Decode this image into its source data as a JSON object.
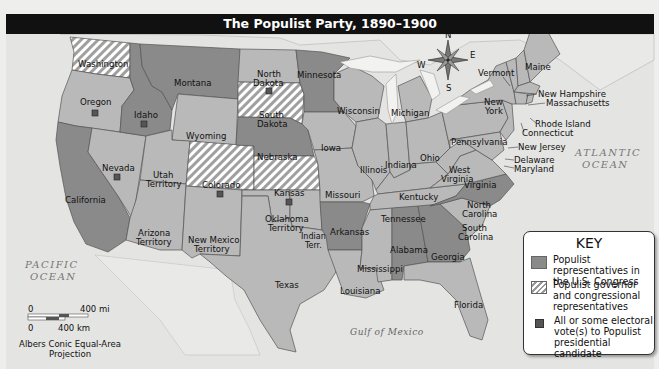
{
  "title": "The Populist Party, 1890–1900",
  "colors": {
    "populist_reps": "#8a8a8a",
    "other_state": "#b9b9b9",
    "water": "#e6e6e4",
    "hatch_light": "#ffffff",
    "hatch_dark": "#9c9c9c",
    "electoral_marker": "#555555",
    "title_bg": "#111111"
  },
  "compass": {
    "n": "N",
    "s": "S",
    "e": "E",
    "w": "W"
  },
  "water_labels": {
    "pacific": [
      "PACIFIC",
      "OCEAN"
    ],
    "atlantic": [
      "ATLANTIC",
      "OCEAN"
    ],
    "gulf": "Gulf of Mexico"
  },
  "states": {
    "washington": {
      "name": "Washington",
      "category": "governor_and_reps",
      "electoral": false
    },
    "oregon": {
      "name": "Oregon",
      "category": "none",
      "electoral": true
    },
    "california": {
      "name": "California",
      "category": "reps",
      "electoral": false
    },
    "idaho": {
      "name": "Idaho",
      "category": "reps",
      "electoral": true
    },
    "nevada": {
      "name": "Nevada",
      "category": "none",
      "electoral": true
    },
    "montana": {
      "name": "Montana",
      "category": "reps",
      "electoral": false
    },
    "wyoming": {
      "name": "Wyoming",
      "category": "none",
      "electoral": false
    },
    "utah": {
      "name": [
        "Utah",
        "Territory"
      ],
      "category": "none",
      "electoral": false
    },
    "arizona": {
      "name": [
        "Arizona",
        "Territory"
      ],
      "category": "none",
      "electoral": false
    },
    "colorado": {
      "name": "Colorado",
      "category": "governor_and_reps",
      "electoral": true
    },
    "new_mexico": {
      "name": [
        "New Mexico",
        "Territory"
      ],
      "category": "none",
      "electoral": false
    },
    "north_dakota": {
      "name": [
        "North",
        "Dakota"
      ],
      "category": "none",
      "electoral": true
    },
    "south_dakota": {
      "name": [
        "South",
        "Dakota"
      ],
      "category": "governor_and_reps",
      "electoral": false
    },
    "nebraska": {
      "name": "Nebraska",
      "category": "reps",
      "electoral": false
    },
    "kansas": {
      "name": "Kansas",
      "category": "governor_and_reps",
      "electoral": true
    },
    "oklahoma": {
      "name": [
        "Oklahoma",
        "Territory"
      ],
      "category": "none",
      "electoral": false
    },
    "indian_territory": {
      "name": [
        "Indian",
        "Terr."
      ],
      "category": "none",
      "electoral": false
    },
    "texas": {
      "name": "Texas",
      "category": "none",
      "electoral": false
    },
    "minnesota": {
      "name": "Minnesota",
      "category": "reps",
      "electoral": false
    },
    "iowa": {
      "name": "Iowa",
      "category": "none",
      "electoral": false
    },
    "missouri": {
      "name": "Missouri",
      "category": "none",
      "electoral": false
    },
    "arkansas": {
      "name": "Arkansas",
      "category": "reps",
      "electoral": false
    },
    "louisiana": {
      "name": "Louisiana",
      "category": "none",
      "electoral": false
    },
    "wisconsin": {
      "name": "Wisconsin",
      "category": "none",
      "electoral": false
    },
    "illinois": {
      "name": "Illinois",
      "category": "none",
      "electoral": false
    },
    "michigan": {
      "name": "Michigan",
      "category": "none",
      "electoral": false
    },
    "indiana": {
      "name": "Indiana",
      "category": "none",
      "electoral": false
    },
    "ohio": {
      "name": "Ohio",
      "category": "none",
      "electoral": false
    },
    "kentucky": {
      "name": "Kentucky",
      "category": "none",
      "electoral": false
    },
    "tennessee": {
      "name": "Tennessee",
      "category": "none",
      "electoral": false
    },
    "mississippi": {
      "name": "Mississippi",
      "category": "none",
      "electoral": false
    },
    "alabama": {
      "name": "Alabama",
      "category": "reps",
      "electoral": false
    },
    "georgia": {
      "name": "Georgia",
      "category": "reps",
      "electoral": false
    },
    "florida": {
      "name": "Florida",
      "category": "none",
      "electoral": false
    },
    "south_carolina": {
      "name": [
        "South",
        "Carolina"
      ],
      "category": "none",
      "electoral": false
    },
    "north_carolina": {
      "name": [
        "North",
        "Carolina"
      ],
      "category": "reps",
      "electoral": false
    },
    "virginia": {
      "name": "Virginia",
      "category": "none",
      "electoral": false
    },
    "west_virginia": {
      "name": [
        "West",
        "Virginia"
      ],
      "category": "none",
      "electoral": false
    },
    "pennsylvania": {
      "name": "Pennsylvania",
      "category": "none",
      "electoral": false
    },
    "new_york": {
      "name": [
        "New",
        "York"
      ],
      "category": "none",
      "electoral": false
    },
    "vermont": {
      "name": "Vermont",
      "category": "none",
      "electoral": false
    },
    "maine": {
      "name": "Maine",
      "category": "none",
      "electoral": false
    },
    "new_hampshire": {
      "name": "New Hampshire",
      "category": "none",
      "electoral": false
    },
    "massachusetts": {
      "name": "Massachusetts",
      "category": "none",
      "electoral": false
    },
    "rhode_island": {
      "name": "Rhode Island",
      "category": "none",
      "electoral": false
    },
    "connecticut": {
      "name": "Connecticut",
      "category": "none",
      "electoral": false
    },
    "new_jersey": {
      "name": "New Jersey",
      "category": "none",
      "electoral": false
    },
    "delaware": {
      "name": "Delaware",
      "category": "none",
      "electoral": false
    },
    "maryland": {
      "name": "Maryland",
      "category": "none",
      "electoral": false
    }
  },
  "key": {
    "title": "KEY",
    "items": [
      {
        "swatch": "solid",
        "text": "Populist representatives in the U.S. Congress"
      },
      {
        "swatch": "hatch",
        "text": "Populist governor and congressional representatives"
      },
      {
        "swatch": "marker",
        "text": "All or some electoral vote(s) to Populist presidential candidate"
      }
    ]
  },
  "scale": {
    "mi_zero": "0",
    "mi_label": "400 mi",
    "km_zero": "0",
    "km_label": "400 km",
    "projection": [
      "Albers Conic Equal-Area",
      "Projection"
    ]
  }
}
